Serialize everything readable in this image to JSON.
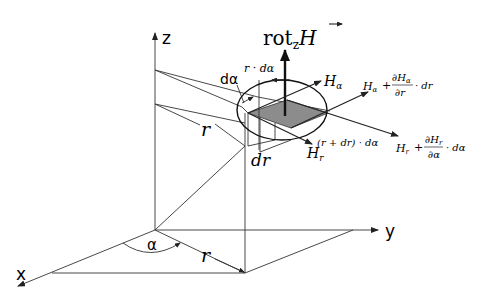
{
  "diagram": {
    "axes": {
      "x_label": "x",
      "y_label": "y",
      "z_label": "z"
    },
    "labels": {
      "alpha": "α",
      "r_ground": "r",
      "r_upper": "r",
      "d_alpha": "dα",
      "r_d_alpha": "r · dα",
      "dr": "dr",
      "r_plus_dr_d_alpha": "(r + dr) · dα",
      "rot_main": "rot",
      "rot_sub": "z",
      "rot_vec": "H",
      "H_alpha": "H",
      "H_alpha_sub": "α",
      "H_r": "H",
      "H_r_sub": "r",
      "H_alpha_plus": {
        "lead": "H",
        "lead_sub": "α",
        "plus": "+",
        "num": "∂H",
        "num_sub": "α",
        "den": "∂r",
        "tail": "· dr"
      },
      "H_r_plus": {
        "lead": "H",
        "lead_sub": "r",
        "plus": "+",
        "num": "∂H",
        "num_sub": "r",
        "den": "∂α",
        "tail": "· dα"
      }
    },
    "colors": {
      "line": "#222222",
      "shaded_area": "#8c8c8c",
      "background": "#ffffff"
    }
  }
}
